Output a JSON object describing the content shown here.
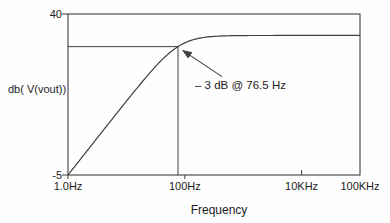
{
  "colors": {
    "line": "#3f3f3f",
    "text": "#1c1c1c",
    "background": "#fefefe"
  },
  "chart_data": {
    "type": "line",
    "title": "",
    "xlabel": "Frequency",
    "ylabel": "db( V(vout))",
    "x_scale": "log",
    "xlim": [
      1,
      100000
    ],
    "ylim": [
      -5,
      40
    ],
    "grid": false,
    "legend": "none",
    "x_ticks": [
      {
        "value": 1,
        "label": "1.0Hz",
        "tick_side": "below"
      },
      {
        "value": 100,
        "label": "100Hz",
        "tick_side": "below"
      },
      {
        "value": 10000,
        "label": "10KHz",
        "tick_side": "inside"
      },
      {
        "value": 100000,
        "label": "100KHz",
        "tick_side": "none"
      }
    ],
    "y_ticks": [
      {
        "value": 40,
        "label": "40"
      },
      {
        "value": -5,
        "label": "-5"
      }
    ],
    "series": [
      {
        "name": "db(V(vout))",
        "model": "first_order_highpass",
        "passband_gain_db": 34,
        "cutoff_hz": 76.5,
        "start_db_at_xmin": -5,
        "key_points": [
          {
            "hz": 1.0,
            "db": -5
          },
          {
            "hz": 76.5,
            "db": 31
          },
          {
            "hz": 100000,
            "db": 34
          }
        ]
      }
    ],
    "reference_lines": {
      "horizontal_db": 31,
      "vertical_hz": 76.5
    },
    "annotation": {
      "text": "– 3 dB @ 76.5 Hz",
      "points_to": {
        "hz": 76.5,
        "db": 31
      }
    }
  }
}
